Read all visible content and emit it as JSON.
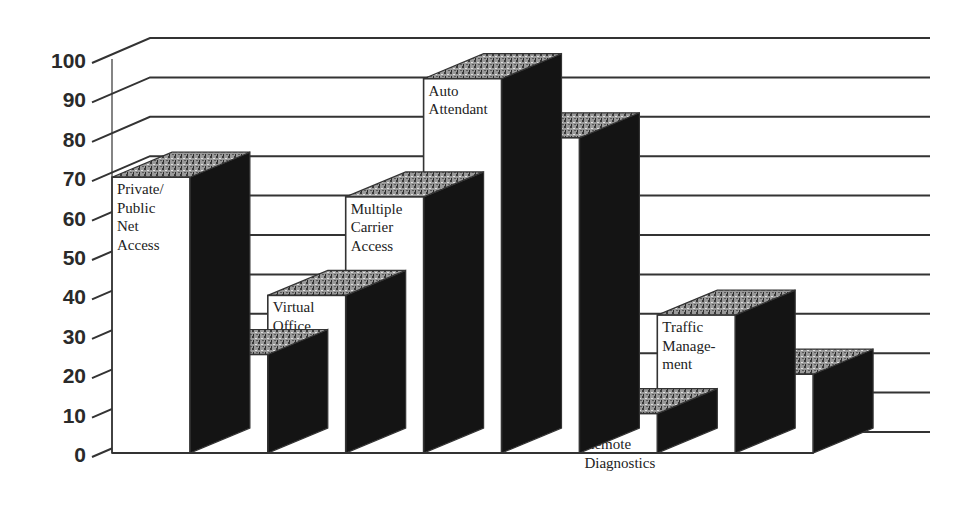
{
  "chart_data": {
    "type": "bar",
    "style": "3d-column",
    "title": "",
    "xlabel": "",
    "ylabel": "",
    "ylim": [
      0,
      100
    ],
    "yticks": [
      0,
      10,
      20,
      30,
      40,
      50,
      60,
      70,
      80,
      90,
      100
    ],
    "grid": true,
    "legend": null,
    "categories": [
      "Private/ Public Net Access",
      "ACD Call Transfer",
      "Virtual Office Access",
      "Multiple Carrier Access",
      "Auto Attendant",
      "International Business",
      "24 Hour Remote Diagnostics",
      "Traffic Management",
      "Call Forward External"
    ],
    "values": [
      70,
      25,
      40,
      65,
      95,
      80,
      10,
      35,
      20
    ],
    "label_lines": [
      [
        "Private/",
        "Public",
        "Net",
        "Access"
      ],
      [
        "ACD",
        "Call",
        "Transfer"
      ],
      [
        "Virtual",
        "Office",
        "Access"
      ],
      [
        "Multiple",
        "Carrier",
        "Access"
      ],
      [
        "Auto",
        "Attendant"
      ],
      [
        "Inter-",
        "national",
        "Business"
      ],
      [
        "24 Hour",
        "Remote",
        "Diagnostics"
      ],
      [
        "Traffic",
        "Manage-",
        "ment"
      ],
      [
        "Call",
        "Forward",
        "External"
      ]
    ]
  },
  "colors": {
    "bar_front": "#ffffff",
    "bar_side": "#141414",
    "bar_top": "#8a8a8a",
    "gridline": "#333333",
    "text": "#222222"
  }
}
